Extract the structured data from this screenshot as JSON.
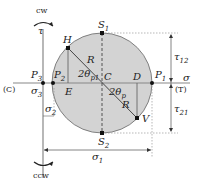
{
  "diagram": {
    "colors": {
      "circle_fill": "#d3d3d3",
      "lines": "#555555",
      "dashed": "#888888",
      "points": "#111111"
    },
    "labels": {
      "cw": "cw",
      "ccw": "ccw",
      "tau_axis": "τ",
      "sigma_axis": "σ",
      "compression": "(C)",
      "tension": "(T)",
      "S1": "S",
      "S1_sub": "1",
      "S2": "S",
      "S2_sub": "2",
      "H": "H",
      "V": "V",
      "C": "C",
      "D": "D",
      "E": "E",
      "R_top": "R",
      "R_bottom": "R",
      "P1": "P",
      "P1_sub": "1",
      "P2": "P",
      "P2_sub": "2",
      "P3": "P",
      "P3_sub": "3",
      "angle_top": "2θ",
      "angle_top_sub": "p1",
      "angle_bottom": "2θ",
      "angle_bottom_sub": "p",
      "sigma3": "σ",
      "sigma3_sub": "3",
      "sigma2": "σ",
      "sigma2_sub": "2",
      "sigma1": "σ",
      "sigma1_sub": "1",
      "tau12": "τ",
      "tau12_sub": "12",
      "tau21": "τ",
      "tau21_sub": "21"
    }
  }
}
